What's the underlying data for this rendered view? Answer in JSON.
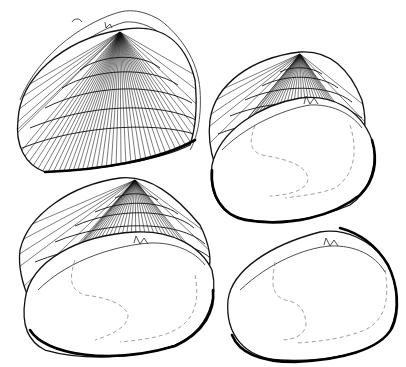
{
  "figure": {
    "corner_label": "5",
    "specimens": [
      {
        "id": "shell-1",
        "view": "exterior",
        "position": "top-left"
      },
      {
        "id": "shell-2",
        "view": "exterior-and-interior",
        "position": "top-right"
      },
      {
        "id": "shell-3",
        "view": "exterior-and-interior",
        "position": "bottom-left"
      },
      {
        "id": "shell-4",
        "view": "interior",
        "position": "bottom-right"
      }
    ],
    "colors": {
      "ink": "#111111",
      "background": "#ffffff",
      "scar_line": "#777777"
    }
  }
}
